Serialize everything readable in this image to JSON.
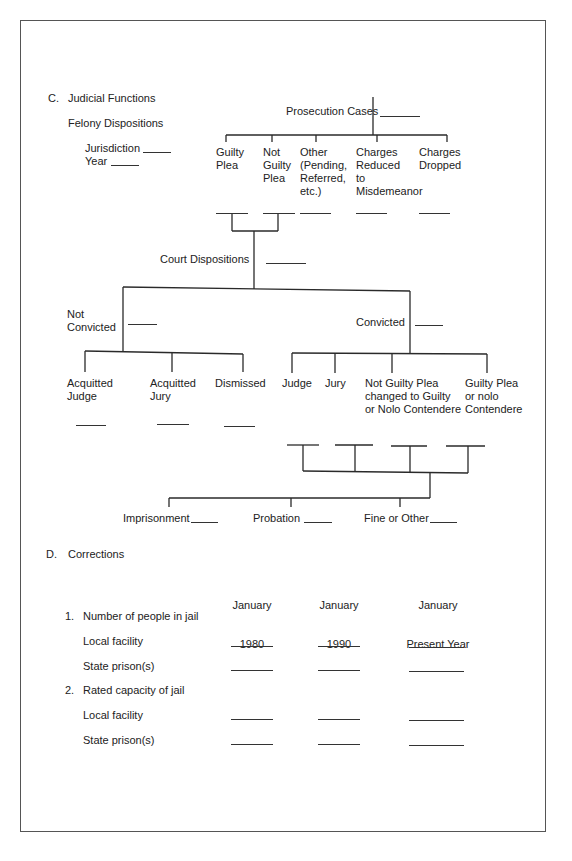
{
  "section_c": {
    "heading_letter": "C.",
    "heading": "Judicial Functions",
    "subheading": "Felony Dispositions",
    "jurisdiction_label": "Jurisdiction",
    "year_label": "Year",
    "prosecution": {
      "label": "Prosecution Cases",
      "branches": [
        {
          "label": "Guilty\nPlea"
        },
        {
          "label": "Not\nGuilty\nPlea"
        },
        {
          "label": "Other\n(Pending,\nReferred,\netc.)"
        },
        {
          "label": "Charges\nReduced\nto\nMisdemeanor"
        },
        {
          "label": "Charges\nDropped"
        }
      ]
    },
    "court_dispositions_label": "Court Dispositions",
    "not_convicted": {
      "label": "Not\nConvicted",
      "branches": [
        {
          "label": "Acquitted\nJudge"
        },
        {
          "label": "Acquitted\nJury"
        },
        {
          "label": "Dismissed"
        }
      ]
    },
    "convicted": {
      "label": "Convicted",
      "branches": [
        {
          "label": "Judge"
        },
        {
          "label": "Jury"
        },
        {
          "label": "Not Guilty Plea\nchanged to Guilty\nor Nolo Contendere"
        },
        {
          "label": "Guilty Plea\nor nolo\nContendere"
        }
      ]
    },
    "sentences": [
      {
        "label": "Imprisonment"
      },
      {
        "label": "Probation"
      },
      {
        "label": "Fine or Other"
      }
    ]
  },
  "section_d": {
    "heading_letter": "D.",
    "heading": "Corrections",
    "columns": [
      {
        "line1": "January",
        "line2": "1980"
      },
      {
        "line1": "January",
        "line2": "1990"
      },
      {
        "line1": "January",
        "line2": "Present Year"
      }
    ],
    "groups": [
      {
        "number": "1.",
        "title": "Number of people in jail",
        "rows": [
          {
            "label": "Local facility"
          },
          {
            "label": "State prison(s)"
          }
        ]
      },
      {
        "number": "2.",
        "title": "Rated capacity of jail",
        "rows": [
          {
            "label": "Local facility"
          },
          {
            "label": "State prison(s)"
          }
        ]
      }
    ]
  }
}
